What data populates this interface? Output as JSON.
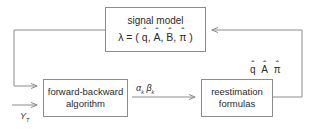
{
  "diagram": {
    "line_color": "#8c8c8c",
    "text_color": "#2b2b2b",
    "background": "#ffffff",
    "nodes": {
      "signal_model": {
        "label": "signal model",
        "formula_lambda": "λ",
        "formula_equals": "= (",
        "formula_q": "q",
        "formula_a": "A",
        "formula_b": "B",
        "formula_pi": "π",
        "formula_close": ")",
        "formula_comma": ",",
        "hat": "ˆ",
        "formula_full": "λ = ( q̂, Â, B̂, π̂ )"
      },
      "forward_backward": {
        "line_1": "forward-backward",
        "line_2": "algorithm"
      },
      "reestimation": {
        "line_1": "reestimation",
        "line_2": "formulas"
      }
    },
    "edge_labels": {
      "alpha_beta": {
        "alpha": "α",
        "alpha_sub": "k",
        "beta": "β",
        "beta_sub": "k",
        "full": "αk βk"
      },
      "observations": {
        "symbol": "Y",
        "subscript": "T",
        "full": "YT"
      },
      "estimated_params": {
        "q": "q",
        "a": "A",
        "pi": "π",
        "hat": "ˆ",
        "full": "q̂ Â π̂"
      }
    },
    "edges": [
      {
        "name": "signal-model-to-forward-backward",
        "from": "signal_model",
        "to": "forward_backward",
        "arrowhead": "right"
      },
      {
        "name": "forward-backward-to-reestimation",
        "from": "forward_backward",
        "to": "reestimation",
        "arrowhead": "right",
        "label": "αk βk"
      },
      {
        "name": "reestimation-to-signal-model",
        "from": "reestimation",
        "to": "signal_model",
        "arrowhead": "left",
        "label": "q̂ Â π̂"
      },
      {
        "name": "observations-input",
        "from": "external",
        "to": "forward_backward",
        "arrowhead": "right",
        "label": "YT"
      }
    ]
  }
}
